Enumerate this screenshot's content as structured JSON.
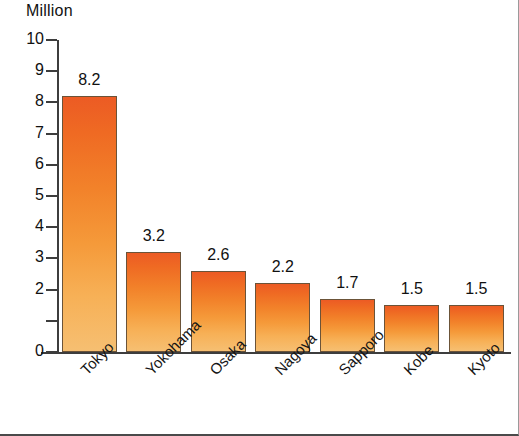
{
  "chart_data": {
    "type": "bar",
    "title": "",
    "unit_label": "Million",
    "xlabel": "",
    "ylabel": "Million",
    "categories": [
      "Tokyo",
      "Yokohama",
      "Osaka",
      "Nagoya",
      "Sapporo",
      "Kobe",
      "Kyoto"
    ],
    "values": [
      8.2,
      3.2,
      2.6,
      2.2,
      1.7,
      1.5,
      1.5
    ],
    "value_labels": [
      "8.2",
      "3.2",
      "2.6",
      "2.2",
      "1.7",
      "1.5",
      "1.5"
    ],
    "ylim": [
      0,
      10
    ],
    "y_ticks": [
      0,
      1,
      2,
      3,
      4,
      5,
      6,
      7,
      8,
      9,
      10
    ],
    "y_tick_labels": [
      "0",
      "",
      "2",
      "3",
      "4",
      "5",
      "6",
      "7",
      "8",
      "9",
      "10"
    ],
    "grid": false,
    "legend": null,
    "bar_color_top": "#ec5b24",
    "bar_color_bottom": "#f6bf72",
    "bar_outline_color": "#6b5338",
    "axis_color": "#3d3d3d",
    "text_color": "#111111",
    "background_color": "#ffffff",
    "category_label_rotation": -45
  }
}
